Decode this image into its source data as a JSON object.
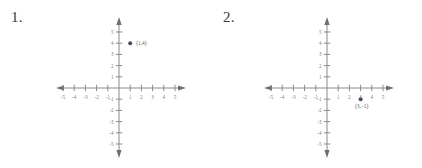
{
  "page": {
    "background_color": "#ffffff",
    "axis_color": "#8a8a8a",
    "label_color": "#7d7d7d",
    "point_color": "#4a4a5e"
  },
  "problems": [
    {
      "number_label": "1.",
      "name": "problem-1",
      "chart_data": {
        "type": "scatter",
        "title": "",
        "xlabel": "",
        "ylabel": "",
        "xlim": [
          -6,
          6
        ],
        "ylim": [
          -6,
          6
        ],
        "grid": false,
        "legend": "none",
        "x_ticks": [
          -5,
          -4,
          -3,
          -2,
          -1,
          1,
          2,
          3,
          4,
          5
        ],
        "y_ticks": [
          5,
          4,
          3,
          2,
          1,
          -1,
          -2,
          -3,
          -4,
          -5
        ],
        "x_tick_labels": [
          "-5",
          "-4",
          "-3",
          "-2",
          "-1",
          "1",
          "2",
          "3",
          "4",
          "5"
        ],
        "y_tick_labels": [
          "5",
          "4",
          "3",
          "2",
          "1",
          "-1",
          "-2",
          "-3",
          "-4",
          "-5"
        ],
        "points": [
          {
            "x": 1,
            "y": 4,
            "label": "(1,4)"
          }
        ]
      }
    },
    {
      "number_label": "2.",
      "name": "problem-2",
      "chart_data": {
        "type": "scatter",
        "title": "",
        "xlabel": "",
        "ylabel": "",
        "xlim": [
          -6,
          6
        ],
        "ylim": [
          -6,
          6
        ],
        "grid": false,
        "legend": "none",
        "x_ticks": [
          -5,
          -4,
          -3,
          -2,
          -1,
          1,
          2,
          3,
          4,
          5
        ],
        "y_ticks": [
          5,
          4,
          3,
          2,
          1,
          -1,
          -2,
          -3,
          -4,
          -5
        ],
        "x_tick_labels": [
          "-5",
          "-4",
          "-3",
          "-2",
          "-1",
          "1",
          "2",
          "3",
          "4",
          "5"
        ],
        "y_tick_labels": [
          "5",
          "4",
          "3",
          "2",
          "1",
          "-1",
          "-2",
          "-3",
          "-4",
          "-5"
        ],
        "points": [
          {
            "x": 3,
            "y": -1,
            "label": "(3,−1)"
          }
        ]
      }
    }
  ]
}
